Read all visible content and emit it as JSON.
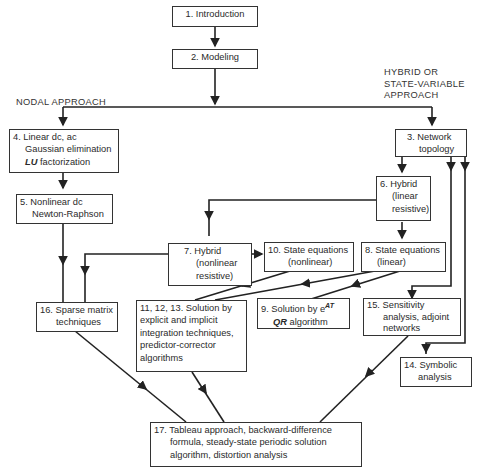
{
  "labels": {
    "nodal": "NODAL APPROACH",
    "hybrid_1": "HYBRID OR",
    "hybrid_2": "STATE-VARIABLE",
    "hybrid_3": "APPROACH"
  },
  "nodes": {
    "n1": [
      "1. Introduction"
    ],
    "n2": [
      "2. Modeling"
    ],
    "n3": [
      "3. Network",
      "topology"
    ],
    "n4": [
      "4. Linear dc, ac",
      "Gaussian elimination",
      "LU",
      " factorization"
    ],
    "n5": [
      "5. Nonlinear dc",
      "Newton-Raphson"
    ],
    "n6": [
      "6. Hybrid",
      "(linear",
      "resistive)"
    ],
    "n7": [
      "7. Hybrid",
      "(nonlinear",
      "resistive)"
    ],
    "n8": [
      "8. State equations",
      "(linear)"
    ],
    "n9": [
      "9. Solution by e",
      "AT",
      "QR",
      " algorithm"
    ],
    "n10": [
      "10. State equations",
      "(nonlinear)"
    ],
    "n11": [
      "11, 12, 13. Solution by",
      "explicit and implicit",
      "integration techniques,",
      "predictor-corrector",
      "algorithms"
    ],
    "n14": [
      "14. Symbolic",
      "analysis"
    ],
    "n15": [
      "15. Sensitivity",
      "analysis, adjoint",
      "networks"
    ],
    "n16": [
      "16. Sparse matrix",
      "techniques"
    ],
    "n17": [
      "17. Tableau approach, backward-difference",
      "formula, steady-state periodic solution",
      "algorithm, distortion analysis"
    ]
  }
}
